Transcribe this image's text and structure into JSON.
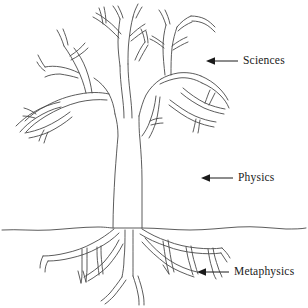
{
  "figure": {
    "background_color": "#ffffff",
    "ink_color": "#4a4a4a",
    "text_color": "#1a1a1a",
    "ground_line_y": 228
  },
  "annotations": [
    {
      "id": "sciences",
      "label": "Sciences",
      "icon": "left-arrow-icon",
      "target": "branches",
      "x": 205,
      "y": 55
    },
    {
      "id": "physics",
      "label": "Physics",
      "icon": "left-arrow-icon",
      "target": "trunk",
      "x": 200,
      "y": 172
    },
    {
      "id": "metaphysics",
      "label": "Metaphysics",
      "icon": "left-arrow-icon",
      "target": "roots",
      "x": 196,
      "y": 266
    }
  ]
}
